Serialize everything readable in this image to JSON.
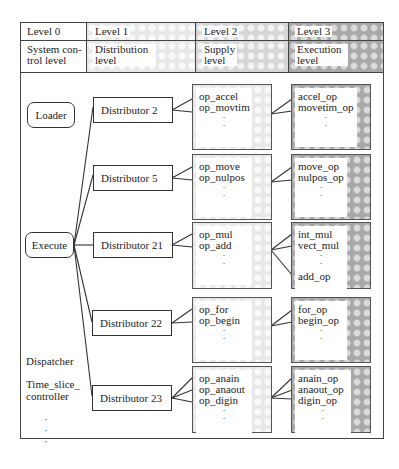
{
  "header": {
    "levels": [
      {
        "level": "Level 0",
        "name": "System con-\ntrol level"
      },
      {
        "level": "Level 1",
        "name": "Distribution\nlevel"
      },
      {
        "level": "Level 2",
        "name": "Supply\nlevel"
      },
      {
        "level": "Level 3",
        "name": "Execution\nlevel"
      }
    ]
  },
  "system_control": {
    "loader": "Loader",
    "execute": "Execute",
    "dispatcher": "Dispatcher",
    "time_slice_controller_1": "Time_slice_",
    "time_slice_controller_2": "controller",
    "ellipsis": "·\n·\n·"
  },
  "distributors": [
    {
      "label": "Distributor 2",
      "supply": [
        "op_accel",
        "op_movtim"
      ],
      "execution": [
        "accel_op",
        "movetim_op"
      ]
    },
    {
      "label": "Distributor 5",
      "supply": [
        "op_move",
        "op_nulpos"
      ],
      "execution": [
        "move_op",
        "nulpos_op"
      ]
    },
    {
      "label": "Distributor 21",
      "supply": [
        "op_mul",
        "op_add"
      ],
      "execution": [
        "int_mul",
        "vect_mul",
        "add_op"
      ]
    },
    {
      "label": "Distributor 22",
      "supply": [
        "op_for",
        "op_begin"
      ],
      "execution": [
        "for_op",
        "begin_op"
      ]
    },
    {
      "label": "Distributor 23",
      "supply": [
        "op_anain",
        "op_anaout",
        "op_digin"
      ],
      "execution": [
        "anain_op",
        "anaout_op",
        "digin_op"
      ]
    }
  ],
  "dots": "·"
}
